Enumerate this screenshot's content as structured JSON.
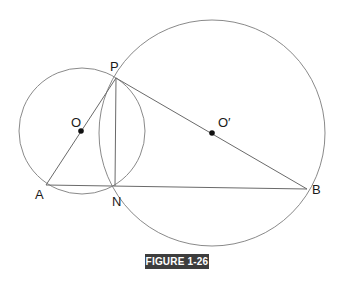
{
  "figure": {
    "caption": "FIGURE 1-26",
    "caption_bg": "#3d3d3d",
    "stroke_color": "#8a8a8a",
    "line_color": "#6a6a6a",
    "points": {
      "P": {
        "label": "P",
        "x": 116,
        "y": 78
      },
      "A": {
        "label": "A",
        "x": 46,
        "y": 185
      },
      "N": {
        "label": "N",
        "x": 115,
        "y": 186
      },
      "B": {
        "label": "B",
        "x": 307,
        "y": 189
      },
      "O": {
        "label": "O",
        "x": 81,
        "y": 131
      },
      "O_prime": {
        "label": "O′",
        "x": 212,
        "y": 133
      }
    },
    "circles": [
      {
        "name": "circle-O",
        "cx": 82,
        "cy": 131,
        "r": 63
      },
      {
        "name": "circle-O-prime",
        "cx": 212,
        "cy": 133,
        "r": 113
      }
    ],
    "segments": [
      "PA",
      "PN",
      "PB",
      "AB"
    ]
  }
}
